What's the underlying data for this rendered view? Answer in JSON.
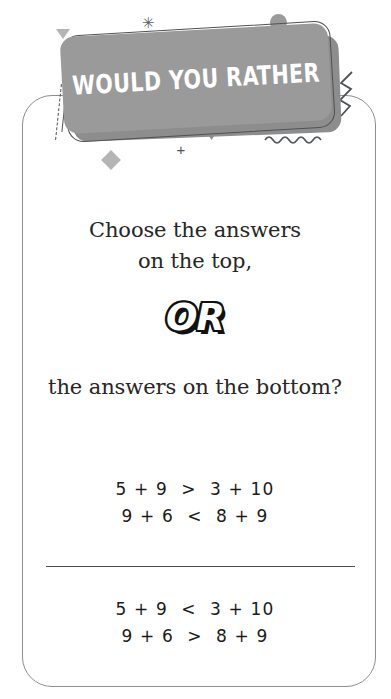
{
  "banner": {
    "title": "WOULD YOU RATHER",
    "bg_color": "#9a9a9a",
    "shadow_color": "#8d8d8d",
    "outline_color": "#4e5257",
    "text_color": "#ffffff"
  },
  "decorations": [
    {
      "name": "sparkle-icon",
      "glyph": "✳"
    },
    {
      "name": "plus-icon",
      "glyph": "+"
    }
  ],
  "card": {
    "border_color": "#8e8e8e",
    "background": "#ffffff"
  },
  "prompt": {
    "line1": "Choose the answers",
    "line2": "on the top,",
    "or": "OR",
    "line3": "the answers on the bottom?",
    "text_color": "#262626"
  },
  "choices": {
    "top": {
      "equations": [
        "5 + 9  >  3 + 10",
        "9 + 6  <  8 + 9"
      ]
    },
    "bottom": {
      "equations": [
        "5 + 9  <  3 + 10",
        "9 + 6  >  8 + 9"
      ]
    },
    "divider_color": "#4a4a4a"
  }
}
